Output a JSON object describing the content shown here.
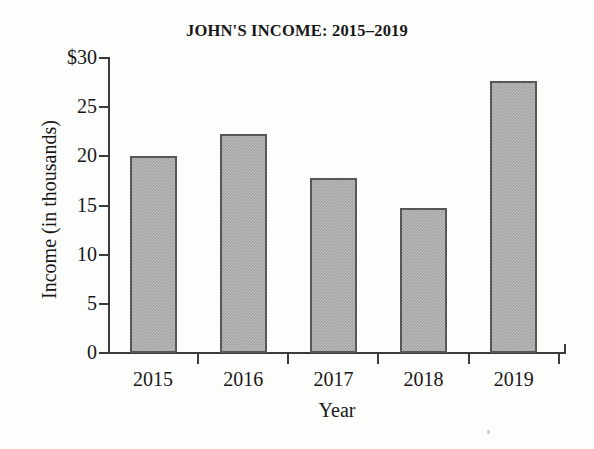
{
  "chart_data": {
    "type": "bar",
    "title": "JOHN'S INCOME: 2015–2019",
    "xlabel": "Year",
    "ylabel": "Income (in thousands)",
    "categories": [
      "2015",
      "2016",
      "2017",
      "2018",
      "2019"
    ],
    "values": [
      20.0,
      22.3,
      17.8,
      14.7,
      27.7
    ],
    "ylim": [
      0,
      30
    ],
    "ytick_values": [
      0,
      5,
      10,
      15,
      20,
      25,
      30
    ],
    "ytick_labels": [
      "0",
      "5",
      "10",
      "15",
      "20",
      "25",
      "$30"
    ],
    "grid": false,
    "legend": null,
    "bar_fill_color": "#a3a3a3",
    "bar_border_color": "#575757",
    "axis_color": "#3b3b3b",
    "background_color": "#fdfdfc",
    "text_color": "#171717"
  }
}
